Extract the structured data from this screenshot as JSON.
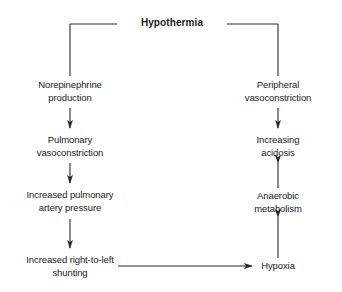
{
  "diagram": {
    "title": "Hypothermia",
    "type": "flowchart",
    "background_color": "#ffffff",
    "line_color": "#2b2b2b",
    "text_color": "#1a1a1a",
    "nodes": {
      "hypothermia": "Hypothermia",
      "norepinephrine_production": "Norepinephrine\nproduction",
      "pulmonary_vasoconstriction": "Pulmonary\nvasoconstriction",
      "increased_pulmonary_artery_pressure": "Increased pulmonary\nartery pressure",
      "increased_right_to_left_shunting": "Increased right-to-left\nshunting",
      "peripheral_vasoconstriction": "Peripheral\nvasoconstriction",
      "increasing_acidosis": "Increasing\nacidosis",
      "anaerobic_metabolism": "Anaerobic\nmetabolism",
      "hypoxia": "Hypoxia"
    },
    "edges": [
      {
        "from": "hypothermia",
        "to": "norepinephrine_production",
        "style": "elbow-left",
        "arrowhead": false
      },
      {
        "from": "hypothermia",
        "to": "peripheral_vasoconstriction",
        "style": "elbow-right",
        "arrowhead": false
      },
      {
        "from": "norepinephrine_production",
        "to": "pulmonary_vasoconstriction",
        "style": "vertical-down",
        "arrowhead": true
      },
      {
        "from": "pulmonary_vasoconstriction",
        "to": "increased_pulmonary_artery_pressure",
        "style": "vertical-down",
        "arrowhead": true
      },
      {
        "from": "increased_pulmonary_artery_pressure",
        "to": "increased_right_to_left_shunting",
        "style": "vertical-down",
        "arrowhead": true
      },
      {
        "from": "increased_right_to_left_shunting",
        "to": "hypoxia",
        "style": "horizontal-right",
        "arrowhead": true
      },
      {
        "from": "hypoxia",
        "to": "anaerobic_metabolism",
        "style": "vertical-up",
        "arrowhead": true
      },
      {
        "from": "anaerobic_metabolism",
        "to": "increasing_acidosis",
        "style": "vertical-up",
        "arrowhead": true
      },
      {
        "from": "peripheral_vasoconstriction",
        "to": "increasing_acidosis",
        "style": "vertical-down",
        "arrowhead": true
      }
    ]
  }
}
